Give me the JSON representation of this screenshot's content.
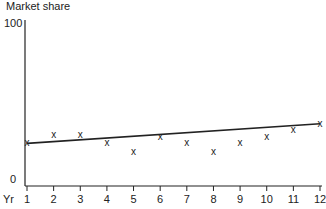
{
  "chart_data": {
    "type": "scatter",
    "title": "",
    "xlabel": "Yr",
    "ylabel": "Market share",
    "ylim": [
      0,
      100
    ],
    "xlim": [
      1,
      12
    ],
    "y_ticks": [
      "0",
      "100"
    ],
    "x_ticks": [
      "1",
      "2",
      "3",
      "4",
      "5",
      "6",
      "7",
      "8",
      "9",
      "10",
      "11",
      "12"
    ],
    "grid": false,
    "marker": "x",
    "x": [
      1,
      2,
      3,
      4,
      5,
      6,
      7,
      8,
      9,
      10,
      11,
      12
    ],
    "values": [
      26,
      31,
      31,
      26,
      21,
      30,
      26,
      21,
      26,
      30,
      34,
      38
    ],
    "series": [
      {
        "name": "Market share",
        "x": [
          1,
          2,
          3,
          4,
          5,
          6,
          7,
          8,
          9,
          10,
          11,
          12
        ],
        "values": [
          26,
          31,
          31,
          26,
          21,
          30,
          26,
          21,
          26,
          30,
          34,
          38
        ]
      },
      {
        "name": "Trend line",
        "type": "line",
        "x": [
          1,
          12
        ],
        "values": [
          26,
          38
        ]
      }
    ]
  },
  "labels": {
    "ylabel": "Market share",
    "y_top": "100",
    "y_bottom": "0",
    "xlabel": "Yr",
    "marker_glyph": "x"
  }
}
